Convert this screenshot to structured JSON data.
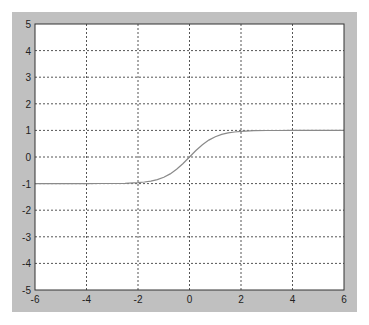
{
  "chart_data": {
    "type": "line",
    "title": "",
    "xlabel": "",
    "ylabel": "",
    "xlim": [
      -6,
      6
    ],
    "ylim": [
      -5,
      5
    ],
    "grid": true,
    "grid_style": "dotted",
    "legend": null,
    "x_ticks": [
      -6,
      -4,
      -2,
      0,
      2,
      4,
      6
    ],
    "y_ticks": [
      -5,
      -4,
      -3,
      -2,
      -1,
      0,
      1,
      2,
      3,
      4,
      5
    ],
    "x_tick_labels": [
      "-6",
      "-4",
      "-2",
      "0",
      "2",
      "4",
      "6"
    ],
    "y_tick_labels": [
      "-5",
      "-4",
      "-3",
      "-2",
      "-1",
      "0",
      "1",
      "2",
      "3",
      "4",
      "5"
    ],
    "series": [
      {
        "name": "tanh(x)",
        "color": "#8a8a8a",
        "x": [
          -6,
          -5,
          -4,
          -3.5,
          -3,
          -2.5,
          -2,
          -1.75,
          -1.5,
          -1.25,
          -1,
          -0.75,
          -0.5,
          -0.25,
          0,
          0.25,
          0.5,
          0.75,
          1,
          1.25,
          1.5,
          1.75,
          2,
          2.5,
          3,
          3.5,
          4,
          5,
          6
        ],
        "y": [
          -1.0,
          -1.0,
          -0.999,
          -0.998,
          -0.995,
          -0.987,
          -0.964,
          -0.941,
          -0.905,
          -0.848,
          -0.762,
          -0.635,
          -0.462,
          -0.245,
          0.0,
          0.245,
          0.462,
          0.635,
          0.762,
          0.848,
          0.905,
          0.941,
          0.964,
          0.987,
          0.995,
          0.998,
          0.999,
          1.0,
          1.0
        ]
      }
    ]
  },
  "colors": {
    "frame_background": "#c0c0c0",
    "plot_background": "#ffffff",
    "axes_color": "#333333",
    "grid_color": "#555555",
    "line_color": "#8a8a8a"
  }
}
